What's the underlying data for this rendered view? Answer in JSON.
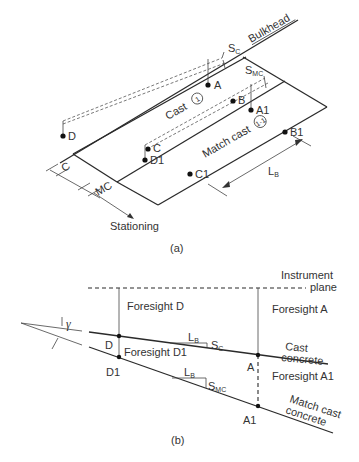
{
  "figure_a": {
    "caption": "(a)",
    "labels": {
      "bulkhead": "Bulkhead",
      "s_c": "S",
      "s_c_sub": "C",
      "s_mc": "S",
      "s_mc_sub": "MC",
      "cast": "Cast",
      "cast_circle": "1",
      "match_cast": "Match cast",
      "match_cast_circle": "1-1",
      "point_a": "A",
      "point_b": "B",
      "point_c": "C",
      "point_d": "D",
      "point_a1": "A1",
      "point_b1": "B1",
      "point_c1": "C1",
      "point_d1": "D1",
      "dim_c": "C",
      "dim_mc": "MC",
      "l_b": "L",
      "l_b_sub": "B",
      "stationing": "Stationing"
    }
  },
  "figure_b": {
    "caption": "(b)",
    "labels": {
      "instrument_line1": "Instrument",
      "instrument_line2": "plane",
      "foresight_d": "Foresight D",
      "foresight_a": "Foresight A",
      "foresight_d1": "Foresight D1",
      "foresight_a1": "Foresight A1",
      "cast_line1": "Cast",
      "cast_line2": "concrete",
      "match_line1": "Match cast",
      "match_line2": "concrete",
      "point_d": "D",
      "point_d1": "D1",
      "point_a": "A",
      "point_a1": "A1",
      "l_b": "L",
      "l_b_sub": "B",
      "s_c": "S",
      "s_c_sub": "C",
      "s_mc": "S",
      "s_mc_sub": "MC",
      "gamma": "γ"
    }
  }
}
